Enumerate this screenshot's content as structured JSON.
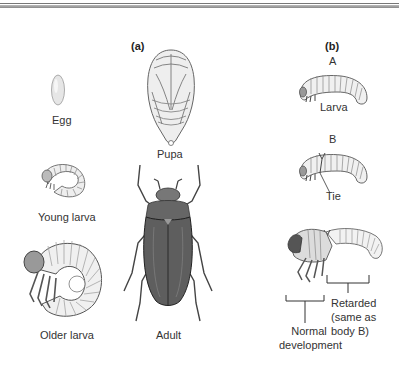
{
  "panels": {
    "a": {
      "label": "(a)",
      "stages": {
        "egg": "Egg",
        "pupa": "Pupa",
        "young_larva": "Young larva",
        "older_larva": "Older larva",
        "adult": "Adult"
      }
    },
    "b": {
      "label": "(b)",
      "specimen_a": {
        "letter": "A",
        "caption": "Larva"
      },
      "specimen_b": {
        "letter": "B",
        "caption": "Tie"
      },
      "result": {
        "normal_line1": "Normal",
        "normal_line2": "development",
        "retarded_line1": "Retarded",
        "retarded_line2": "(same as",
        "retarded_line3": "body B)"
      }
    }
  }
}
